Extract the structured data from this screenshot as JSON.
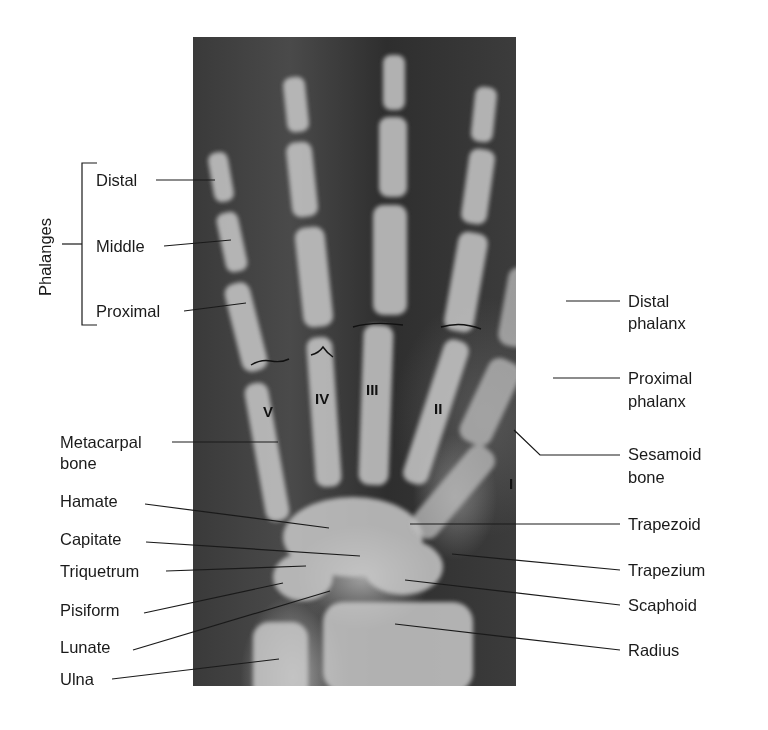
{
  "group_label": "Phalanges",
  "left_labels": {
    "distal": "Distal",
    "middle": "Middle",
    "proximal": "Proximal",
    "metacarpal_l1": "Metacarpal",
    "metacarpal_l2": "bone",
    "hamate": "Hamate",
    "capitate": "Capitate",
    "triquetrum": "Triquetrum",
    "pisiform": "Pisiform",
    "lunate": "Lunate",
    "ulna": "Ulna"
  },
  "right_labels": {
    "distal_phalanx_l1": "Distal",
    "distal_phalanx_l2": "phalanx",
    "proximal_phalanx_l1": "Proximal",
    "proximal_phalanx_l2": "phalanx",
    "sesamoid_l1": "Sesamoid",
    "sesamoid_l2": "bone",
    "trapezoid": "Trapezoid",
    "trapezium": "Trapezium",
    "scaphoid": "Scaphoid",
    "radius": "Radius"
  },
  "metacarpal_numerals": {
    "v": "V",
    "iv": "IV",
    "iii": "III",
    "ii": "II",
    "i": "I"
  },
  "colors": {
    "leader_line": "#1a1a1a",
    "bone": "#d8d8d8",
    "background_film": "#3a3a3a"
  }
}
